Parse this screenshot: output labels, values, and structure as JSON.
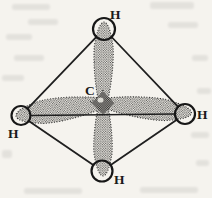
{
  "figure": {
    "center_atom": {
      "label": "C"
    },
    "hydrogen_labels": {
      "top": "H",
      "left": "H",
      "right": "H",
      "bottom": "H"
    },
    "colors": {
      "ink": "#1a1a1a",
      "paper": "#f5f3ee",
      "stipple_dot": "#3a3a3a",
      "bleed_artifact": "#d5d4cf"
    }
  }
}
